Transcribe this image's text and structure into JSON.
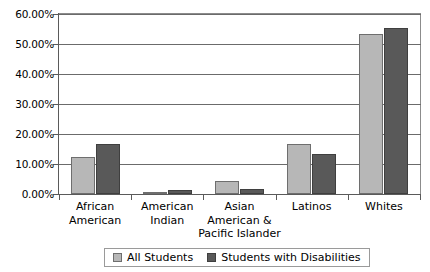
{
  "chart_data": {
    "type": "bar",
    "title": "",
    "subtitle": "",
    "xlabel": "",
    "ylabel": "",
    "categories": [
      "African\nAmerican",
      "American\nIndian",
      "Asian\nAmerican &\nPacific Islander",
      "Latinos",
      "Whites"
    ],
    "series": [
      {
        "name": "All Students",
        "color": "#b7b7b7",
        "values": [
          12.2,
          0.8,
          4.3,
          16.8,
          53.2
        ]
      },
      {
        "name": "Students with Disabilities",
        "color": "#595959",
        "values": [
          16.6,
          1.3,
          1.8,
          13.5,
          55.5
        ]
      }
    ],
    "ylim": [
      0,
      60
    ],
    "ytick_values": [
      0,
      10,
      20,
      30,
      40,
      50,
      60
    ],
    "ytick_labels": [
      "0.00%",
      "10.00%",
      "20.00%",
      "30.00%",
      "40.00%",
      "50.00%",
      "60.00%"
    ],
    "grid": true,
    "grid_axis": "y",
    "legend_position": "bottom",
    "value_format": "percent"
  },
  "legend": {
    "entries": [
      {
        "label": "All Students"
      },
      {
        "label": "Students with Disabilities"
      }
    ]
  }
}
